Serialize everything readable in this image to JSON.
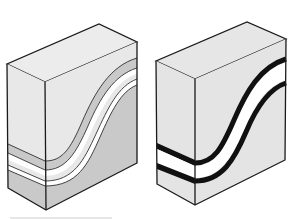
{
  "figure": {
    "blocks": [
      {
        "id": "left",
        "style": "shaded-layers",
        "layers": [
          "light-gray top",
          "gray band",
          "white band",
          "light-gray band",
          "white band",
          "gray base"
        ]
      },
      {
        "id": "right",
        "style": "black-bands",
        "layers": [
          "light-gray top",
          "black band",
          "white band",
          "black band",
          "light-gray base"
        ]
      }
    ]
  },
  "colors": {
    "light": "#e6e6e6",
    "top": "#ececec",
    "gray": "#c9c9c9",
    "white": "#ffffff",
    "stroke": "#1a1a1a"
  }
}
